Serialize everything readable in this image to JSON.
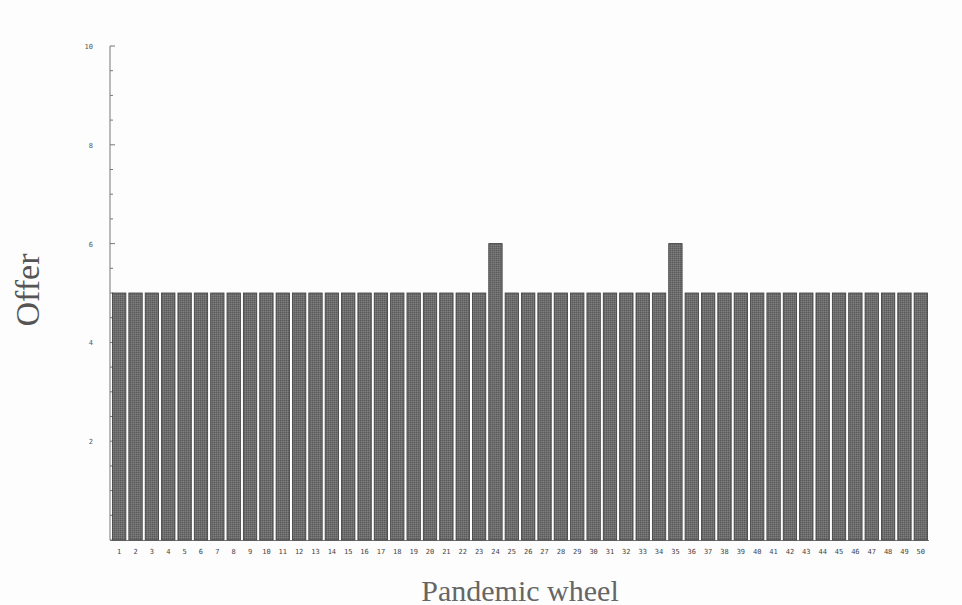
{
  "chart_data": {
    "type": "bar",
    "title": "",
    "xlabel": "Pandemic wheel",
    "ylabel": "Offer",
    "ylim": [
      0,
      10
    ],
    "yticks": [
      0,
      2,
      4,
      6,
      8,
      10
    ],
    "yticks_labeled": [
      "2",
      "4",
      "6",
      "8",
      "10"
    ],
    "grid": false,
    "legend": null,
    "bar_color": "#6a6a6a",
    "bar_edge_color": "#333333",
    "categories": [
      "1",
      "2",
      "3",
      "4",
      "5",
      "6",
      "7",
      "8",
      "9",
      "10",
      "11",
      "12",
      "13",
      "14",
      "15",
      "16",
      "17",
      "18",
      "19",
      "20",
      "21",
      "22",
      "23",
      "24",
      "25",
      "26",
      "27",
      "28",
      "29",
      "30",
      "31",
      "32",
      "33",
      "34",
      "35",
      "36",
      "37",
      "38",
      "39",
      "40",
      "41",
      "42",
      "43",
      "44",
      "45",
      "46",
      "47",
      "48",
      "49",
      "50"
    ],
    "values": [
      5,
      5,
      5,
      5,
      5,
      5,
      5,
      5,
      5,
      5,
      5,
      5,
      5,
      5,
      5,
      5,
      5,
      5,
      5,
      5,
      5,
      5,
      5,
      6,
      5,
      5,
      5,
      5,
      5,
      5,
      5,
      5,
      5,
      5,
      6,
      5,
      5,
      5,
      5,
      5,
      5,
      5,
      5,
      5,
      5,
      5,
      5,
      5,
      5,
      5
    ]
  }
}
